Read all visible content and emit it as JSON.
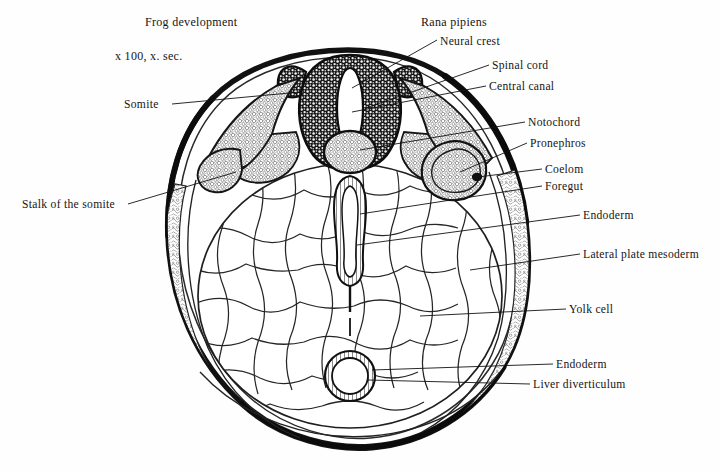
{
  "figure": {
    "title": "Frog development",
    "magnification": "x 100, x. sec.",
    "species": "Rana pipiens",
    "description_type": "cross-section anatomical diagram",
    "ink_color": "#151515",
    "background_color": "#fefefe"
  },
  "labels": {
    "neural_crest": "Neural crest",
    "spinal_cord": "Spinal cord",
    "central_canal": "Central canal",
    "notochord": "Notochord",
    "pronephros": "Pronephros",
    "coelom": "Coelom",
    "foregut": "Foregut",
    "endoderm_upper": "Endoderm",
    "lateral_plate_mesoderm": "Lateral plate mesoderm",
    "yolk_cell": "Yolk cell",
    "endoderm_lower": "Endoderm",
    "liver_diverticulum": "Liver diverticulum",
    "somite": "Somite",
    "stalk_of_the_somite": "Stalk of the somite"
  },
  "structures": [
    {
      "name": "neural-tube",
      "label": "Spinal cord",
      "side": "center-top"
    },
    {
      "name": "central-canal",
      "label": "Central canal",
      "side": "center-top"
    },
    {
      "name": "neural-crest",
      "label": "Neural crest",
      "side": "center-top"
    },
    {
      "name": "notochord",
      "label": "Notochord",
      "side": "center"
    },
    {
      "name": "somite-left",
      "label": "Somite",
      "side": "left"
    },
    {
      "name": "somite-right",
      "label": "Somite",
      "side": "right"
    },
    {
      "name": "somite-stalk",
      "label": "Stalk of the somite",
      "side": "left"
    },
    {
      "name": "pronephros",
      "label": "Pronephros",
      "side": "right"
    },
    {
      "name": "coelom",
      "label": "Coelom",
      "side": "right"
    },
    {
      "name": "foregut",
      "label": "Foregut",
      "side": "center"
    },
    {
      "name": "endoderm",
      "label": "Endoderm",
      "side": "right"
    },
    {
      "name": "lateral-plate-mesoderm",
      "label": "Lateral plate mesoderm",
      "side": "right"
    },
    {
      "name": "yolk-cell-mass",
      "label": "Yolk cell",
      "side": "center"
    },
    {
      "name": "liver-diverticulum",
      "label": "Liver diverticulum",
      "side": "center-bottom"
    }
  ]
}
